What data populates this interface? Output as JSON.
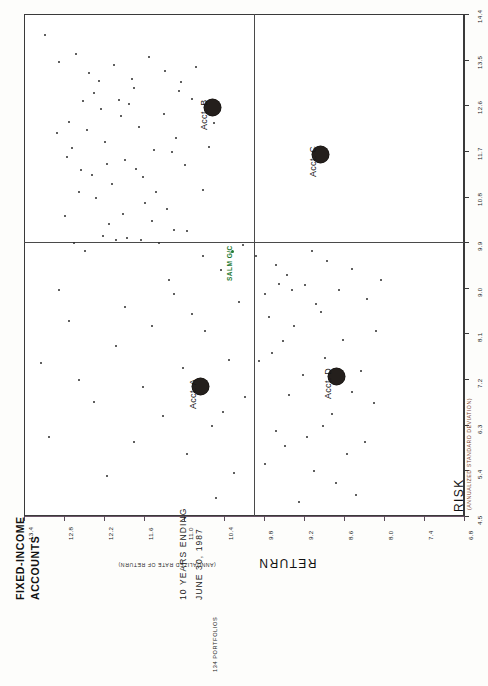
{
  "header": {
    "title_line1": "FIXED-INCOME",
    "title_line2": "ACCOUNTS",
    "subtitle_line1": "10 YEARS ENDING",
    "subtitle_line2": "JUNE 30, 1987",
    "portfolio_count": "134 PORTFOLIOS"
  },
  "axes": {
    "x_title": "RETURN",
    "x_subtitle": "(ANNUALIZED RATE OF RETURN)",
    "y_title": "RISK",
    "y_subtitle": "(ANNUALIZED STANDARD DEVIATION)"
  },
  "chart_data": {
    "type": "scatter",
    "subtitle": "10 YEARS ENDING JUNE 30, 1987",
    "xlabel": "RETURN (ANNUALIZED RATE OF RETURN)",
    "ylabel": "RISK (ANNUALIZED STANDARD DEVIATION)",
    "xlim": [
      6.8,
      13.4
    ],
    "ylim": [
      4.5,
      14.4
    ],
    "x_inverted": true,
    "grid": false,
    "legend": "none",
    "xticks": [
      13.4,
      12.8,
      12.2,
      11.6,
      11.0,
      10.4,
      9.8,
      9.2,
      8.6,
      8.0,
      7.4,
      6.8
    ],
    "yticks": [
      4.5,
      5.4,
      6.3,
      7.2,
      8.1,
      9.0,
      9.9,
      10.8,
      11.7,
      12.6,
      13.5,
      14.4
    ],
    "quadrant_lines": {
      "x": 9.95,
      "y": 9.9
    },
    "colors": {
      "marker": "#241f1c",
      "point": "#2b2b2b",
      "benchmark": "#1f7a33",
      "axis": "#3a3a3a"
    },
    "highlighted": [
      {
        "label": "Acct. A",
        "x": 10.75,
        "y": 7.05
      },
      {
        "label": "Acct. B",
        "x": 10.58,
        "y": 12.55
      },
      {
        "label": "Acct. C",
        "x": 8.95,
        "y": 11.62
      },
      {
        "label": "Acct. D",
        "x": 8.72,
        "y": 7.25
      }
    ],
    "benchmark": {
      "label": "SALM G/C",
      "x": 10.28,
      "y": 9.72
    },
    "points": [
      [
        13.08,
        13.98
      ],
      [
        12.42,
        13.23
      ],
      [
        11.98,
        12.7
      ],
      [
        12.72,
        12.28
      ],
      [
        11.52,
        13.55
      ],
      [
        12.18,
        11.88
      ],
      [
        11.75,
        12.95
      ],
      [
        12.9,
        12.05
      ],
      [
        11.3,
        12.42
      ],
      [
        12.05,
        13.4
      ],
      [
        11.88,
        11.52
      ],
      [
        12.55,
        11.32
      ],
      [
        11.12,
        11.95
      ],
      [
        12.32,
        10.78
      ],
      [
        11.62,
        11.18
      ],
      [
        12.78,
        10.42
      ],
      [
        11.42,
        10.88
      ],
      [
        12.12,
        10.25
      ],
      [
        11.85,
        9.98
      ],
      [
        12.48,
        9.72
      ],
      [
        11.25,
        10.55
      ],
      [
        12.62,
        13.62
      ],
      [
        11.05,
        13.05
      ],
      [
        12.25,
        12.52
      ],
      [
        11.68,
        12.18
      ],
      [
        10.98,
        11.42
      ],
      [
        11.48,
        10.32
      ],
      [
        12.08,
        11.05
      ],
      [
        11.78,
        13.12
      ],
      [
        12.35,
        12.85
      ],
      [
        10.88,
        12.72
      ],
      [
        11.18,
        11.68
      ],
      [
        12.68,
        11.75
      ],
      [
        11.95,
        12.38
      ],
      [
        12.88,
        13.45
      ],
      [
        10.72,
        10.92
      ],
      [
        11.38,
        9.88
      ],
      [
        12.02,
        9.95
      ],
      [
        11.58,
        10.68
      ],
      [
        12.22,
        10.02
      ],
      [
        10.95,
        10.12
      ],
      [
        11.72,
        11.35
      ],
      [
        12.45,
        12.12
      ],
      [
        11.08,
        12.88
      ],
      [
        12.15,
        11.45
      ],
      [
        10.62,
        11.78
      ],
      [
        11.28,
        13.28
      ],
      [
        12.58,
        10.88
      ],
      [
        11.92,
        10.45
      ],
      [
        12.75,
        11.58
      ],
      [
        10.82,
        13.35
      ],
      [
        11.45,
        11.72
      ],
      [
        12.28,
        13.08
      ],
      [
        11.65,
        9.95
      ],
      [
        12.38,
        11.22
      ],
      [
        10.55,
        12.25
      ],
      [
        11.15,
        10.15
      ],
      [
        12.52,
        12.68
      ],
      [
        11.82,
        12.62
      ],
      [
        12.65,
        9.88
      ],
      [
        9.92,
        9.62
      ],
      [
        9.45,
        9.25
      ],
      [
        9.78,
        8.88
      ],
      [
        9.18,
        9.05
      ],
      [
        9.62,
        9.45
      ],
      [
        8.95,
        8.52
      ],
      [
        9.35,
        8.25
      ],
      [
        8.68,
        8.95
      ],
      [
        9.08,
        9.72
      ],
      [
        8.48,
        9.38
      ],
      [
        9.52,
        7.95
      ],
      [
        8.88,
        7.62
      ],
      [
        9.72,
        8.42
      ],
      [
        8.25,
        8.78
      ],
      [
        9.22,
        7.28
      ],
      [
        8.62,
        7.98
      ],
      [
        9.88,
        7.55
      ],
      [
        8.05,
        9.15
      ],
      [
        9.42,
        6.88
      ],
      [
        8.78,
        6.52
      ],
      [
        9.62,
        6.18
      ],
      [
        8.35,
        7.35
      ],
      [
        9.15,
        6.05
      ],
      [
        8.55,
        5.72
      ],
      [
        9.05,
        5.38
      ],
      [
        8.15,
        6.72
      ],
      [
        9.48,
        5.88
      ],
      [
        8.72,
        5.15
      ],
      [
        9.78,
        5.52
      ],
      [
        8.42,
        4.92
      ],
      [
        9.28,
        4.78
      ],
      [
        8.85,
        9.52
      ],
      [
        9.58,
        9.08
      ],
      [
        8.12,
        8.15
      ],
      [
        9.02,
        8.68
      ],
      [
        8.48,
        6.95
      ],
      [
        9.68,
        7.72
      ],
      [
        8.28,
        5.95
      ],
      [
        9.38,
        8.95
      ],
      [
        8.92,
        6.28
      ],
      [
        10.45,
        9.35
      ],
      [
        10.18,
        8.72
      ],
      [
        10.68,
        8.15
      ],
      [
        10.32,
        7.58
      ],
      [
        10.82,
        7.12
      ],
      [
        10.08,
        6.85
      ],
      [
        10.58,
        6.28
      ],
      [
        10.95,
        5.72
      ],
      [
        10.25,
        5.35
      ],
      [
        10.72,
        9.62
      ],
      [
        11.15,
        8.88
      ],
      [
        11.48,
        8.25
      ],
      [
        10.42,
        6.55
      ],
      [
        11.02,
        7.42
      ],
      [
        11.62,
        7.05
      ],
      [
        10.88,
        8.48
      ],
      [
        11.32,
        6.48
      ],
      [
        12.02,
        7.85
      ],
      [
        11.75,
        5.95
      ],
      [
        12.35,
        6.75
      ],
      [
        12.72,
        8.35
      ],
      [
        12.15,
        5.28
      ],
      [
        11.88,
        8.62
      ],
      [
        12.58,
        7.18
      ],
      [
        13.02,
        6.05
      ],
      [
        10.12,
        9.85
      ],
      [
        10.52,
        4.85
      ],
      [
        11.22,
        9.15
      ],
      [
        12.88,
        8.95
      ],
      [
        13.15,
        7.52
      ]
    ]
  }
}
